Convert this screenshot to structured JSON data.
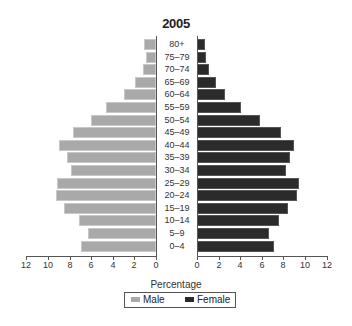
{
  "chart_data": {
    "type": "bar",
    "orientation": "horizontal",
    "subtype": "population-pyramid",
    "title": "2005",
    "xlabel": "Percentage",
    "ylabel": "",
    "categories": [
      "80+",
      "75–79",
      "70–74",
      "65–69",
      "60–64",
      "55–59",
      "50–54",
      "45–49",
      "40–44",
      "35–39",
      "30–34",
      "25–29",
      "20–24",
      "15–19",
      "10–14",
      "5–9",
      "0–4"
    ],
    "series": [
      {
        "name": "Male",
        "color": "#a9a9a9",
        "values": [
          1.1,
          0.9,
          1.2,
          1.9,
          3.0,
          4.6,
          6.0,
          7.7,
          9.0,
          8.2,
          7.9,
          9.2,
          9.3,
          8.5,
          7.1,
          6.3,
          6.9
        ]
      },
      {
        "name": "Female",
        "color": "#2b2b2b",
        "values": [
          0.7,
          0.8,
          1.1,
          1.8,
          2.6,
          4.1,
          5.8,
          7.8,
          9.0,
          8.6,
          8.2,
          9.4,
          9.3,
          8.4,
          7.6,
          6.7,
          7.1
        ]
      }
    ],
    "xlim": [
      0,
      12
    ],
    "x_ticks": [
      0,
      2,
      4,
      6,
      8,
      10,
      12
    ],
    "grid": false,
    "legend_position": "bottom"
  },
  "legend": {
    "male": "Male",
    "female": "Female"
  }
}
